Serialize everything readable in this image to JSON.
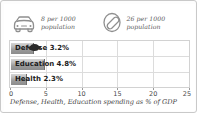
{
  "stats": [
    {
      "icon": "car-icon",
      "value": "8 per 1000",
      "unit": "population"
    },
    {
      "icon": "telephone-receiver-icon",
      "value": "26 per 1000",
      "unit": "population"
    }
  ],
  "caption": "Defense, Health, Education spending as % of GDP",
  "colors": {
    "bar_light": "#d6d6d6",
    "bar_dark": "#8c8c8c",
    "grid": "#dcdcdc",
    "frame": "#c9c9c9",
    "text": "#1c1c1c",
    "muted_text": "#5b5b5b"
  },
  "chart_data": {
    "type": "bar",
    "orientation": "horizontal",
    "title": "",
    "subtitle": "",
    "xlabel": "Defense, Health, Education spending as % of GDP",
    "ylabel": "",
    "categories": [
      "Defense",
      "Education",
      "Health"
    ],
    "values": [
      3.2,
      4.8,
      2.3
    ],
    "data_labels": [
      "Defense 3.2%",
      "Education 4.8%",
      "Health 2.3%"
    ],
    "xlim": [
      0,
      25
    ],
    "xticks": [
      0,
      5,
      10,
      15,
      20,
      25
    ],
    "xtick_labels": [
      "0",
      "5",
      "10",
      "15",
      "20",
      "25"
    ],
    "grid": true,
    "legend": false
  }
}
